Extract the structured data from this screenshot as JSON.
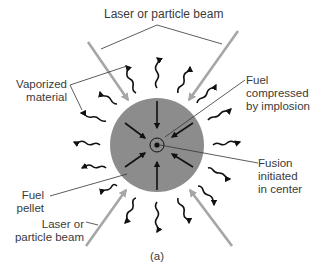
{
  "diagram": {
    "caption": "(a)",
    "colors": {
      "pellet": "#8c8c8c",
      "beam": "#a6a6a6",
      "arrows": "#111111",
      "leader": "#333333",
      "background": "#ffffff"
    },
    "labels": {
      "beam_top": "Laser or particle beam",
      "vaporized_1": "Vaporized",
      "vaporized_2": "material",
      "compressed_1": "Fuel",
      "compressed_2": "compressed",
      "compressed_3": "by implosion",
      "fusion_1": "Fusion",
      "fusion_2": "initiated",
      "fusion_3": "in center",
      "pellet_1": "Fuel",
      "pellet_2": "pellet",
      "beam_bottom_1": "Laser or",
      "beam_bottom_2": "particle beam"
    },
    "nodes": [
      {
        "id": "pellet",
        "shape": "circle",
        "label": "Fuel pellet"
      },
      {
        "id": "core",
        "shape": "circle",
        "label": "Fusion initiated in center"
      },
      {
        "id": "beams",
        "count": 4,
        "label": "Laser or particle beam"
      },
      {
        "id": "inward-arrows",
        "count": 8,
        "label": "Fuel compressed by implosion"
      },
      {
        "id": "vapor-arrows",
        "count": 16,
        "label": "Vaporized material"
      }
    ]
  }
}
